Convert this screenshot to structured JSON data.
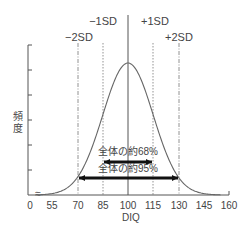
{
  "chart_data": {
    "type": "line",
    "title": "",
    "xlabel": "DIQ",
    "ylabel": "頻度",
    "distribution": "normal",
    "mean": 100,
    "sd": 15,
    "xlim": [
      0,
      160
    ],
    "x_axis_break": true,
    "x_ticks": [
      "0",
      "55",
      "70",
      "85",
      "100",
      "115",
      "130",
      "145",
      "160"
    ],
    "y_ticks_count": 6,
    "y_tick_labels": [],
    "grid": false,
    "reference_lines": [
      {
        "x": 70,
        "label": "−2SD",
        "style": "dash-dot"
      },
      {
        "x": 85,
        "label": "−1SD",
        "style": "dotted"
      },
      {
        "x": 100,
        "label": "",
        "style": "solid"
      },
      {
        "x": 115,
        "label": "+1SD",
        "style": "dotted"
      },
      {
        "x": 130,
        "label": "+2SD",
        "style": "dash-dot"
      }
    ],
    "annotations": [
      {
        "text": "全体の約68%",
        "from": 85,
        "to": 115,
        "type": "double-arrow"
      },
      {
        "text": "全体の約95%",
        "from": 70,
        "to": 130,
        "type": "double-arrow"
      }
    ]
  },
  "labels": {
    "minus1sd": "−1SD",
    "plus1sd": "+1SD",
    "minus2sd": "−2SD",
    "plus2sd": "+2SD",
    "ylabel_1": "頻",
    "ylabel_2": "度",
    "xlabel": "DIQ",
    "range68": "全体の約68%",
    "range95": "全体の約95%",
    "break_mark": "≈",
    "ticks": [
      "0",
      "55",
      "70",
      "85",
      "100",
      "115",
      "130",
      "145",
      "160"
    ]
  }
}
